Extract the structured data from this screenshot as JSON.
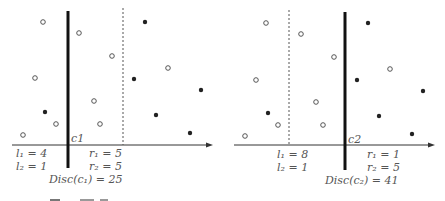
{
  "figure": {
    "caption_partial": "Fig. ... (caption cut off)",
    "colors": {
      "ink": "#222222",
      "label": "#555555",
      "background": "#ffffff"
    }
  },
  "panels": [
    {
      "name": "c1",
      "cut_label": "c1",
      "cut_x": 68,
      "dashed_x": 123,
      "axis": {
        "y": 145,
        "x0": 12,
        "x1": 210
      },
      "l1": "l₁ = 4",
      "l2": "l₂ = 1",
      "r1": "r₁ = 5",
      "r2": "r₂ = 5",
      "disc": "Disc(c₁) = 25",
      "open_points": [
        [
          43,
          22
        ],
        [
          79,
          33
        ],
        [
          35,
          78
        ],
        [
          112,
          56
        ],
        [
          168,
          68
        ],
        [
          94,
          101
        ],
        [
          56,
          124
        ],
        [
          100,
          124
        ],
        [
          23,
          135
        ]
      ],
      "filled_points": [
        [
          45,
          112
        ],
        [
          145,
          22
        ],
        [
          134,
          79
        ],
        [
          201,
          90
        ],
        [
          156,
          115
        ],
        [
          190,
          133
        ]
      ]
    },
    {
      "name": "c2",
      "cut_label": "c2",
      "cut_x": 345,
      "dashed_x": 289,
      "axis": {
        "y": 145,
        "x0": 234,
        "x1": 432
      },
      "l1": "l₁ = 8",
      "l2": "l₂ = 1",
      "r1": "r₁ = 1",
      "r2": "r₂ = 5",
      "disc": "Disc(c₂) = 41",
      "open_points": [
        [
          266,
          23
        ],
        [
          301,
          34
        ],
        [
          256,
          80
        ],
        [
          334,
          57
        ],
        [
          390,
          69
        ],
        [
          316,
          102
        ],
        [
          278,
          125
        ],
        [
          323,
          125
        ],
        [
          245,
          136
        ]
      ],
      "filled_points": [
        [
          268,
          113
        ],
        [
          368,
          23
        ],
        [
          357,
          80
        ],
        [
          423,
          91
        ],
        [
          379,
          116
        ],
        [
          412,
          134
        ]
      ]
    }
  ]
}
